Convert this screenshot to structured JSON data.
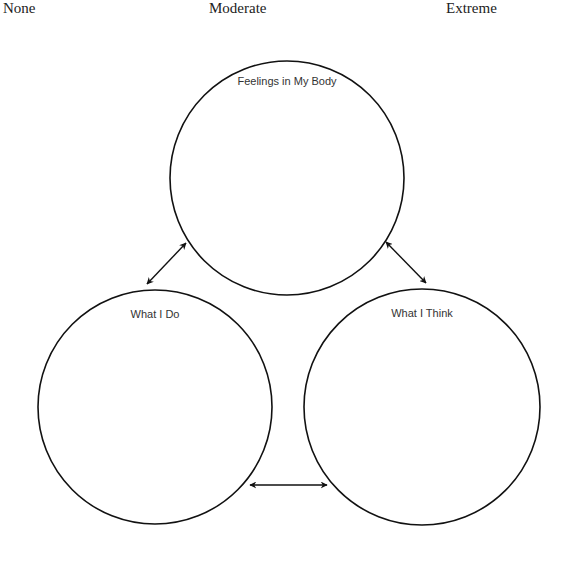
{
  "scale": {
    "labels": [
      "None",
      "Moderate",
      "Extreme"
    ]
  },
  "diagram": {
    "nodes": [
      {
        "id": "body",
        "label": "Feelings in My Body"
      },
      {
        "id": "do",
        "label": "What I Do"
      },
      {
        "id": "think",
        "label": "What I Think"
      }
    ],
    "edges": [
      {
        "from": "body",
        "to": "do",
        "type": "bidirectional"
      },
      {
        "from": "body",
        "to": "think",
        "type": "bidirectional"
      },
      {
        "from": "do",
        "to": "think",
        "type": "bidirectional"
      }
    ]
  }
}
